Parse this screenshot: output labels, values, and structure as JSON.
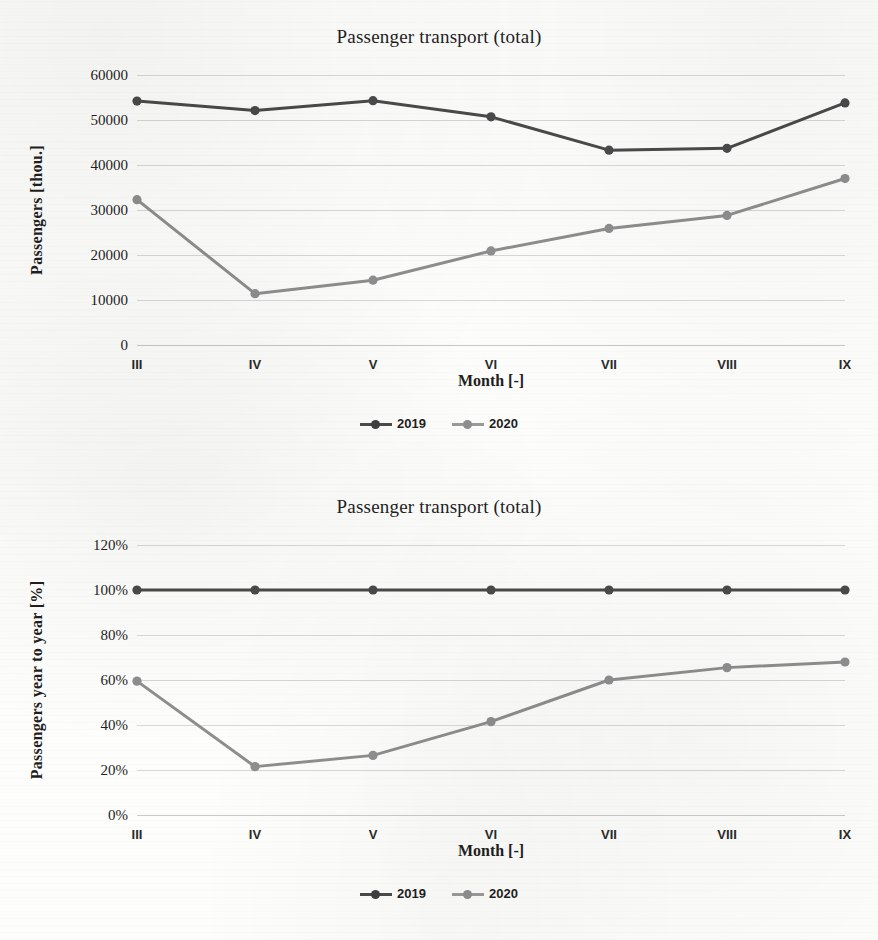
{
  "page": {
    "kind": "scanned-document-figures"
  },
  "figures": [
    {
      "id": "figure-passenger-transport-absolute",
      "title": "Passenger transport (total)",
      "xlabel": "Month [-]",
      "ylabel": "Passengers [thou.]",
      "legend": [
        {
          "label": "2019",
          "color": "#4a4a4a"
        },
        {
          "label": "2020",
          "color": "#8e8e8e"
        }
      ],
      "yticks": [
        "0",
        "10000",
        "20000",
        "30000",
        "40000",
        "50000",
        "60000"
      ],
      "xticks": [
        "III",
        "IV",
        "V",
        "VI",
        "VII",
        "VIII",
        "IX"
      ]
    },
    {
      "id": "figure-passenger-transport-yoy",
      "title": "Passenger transport (total)",
      "xlabel": "Month [-]",
      "ylabel": "Passengers year to year  [%]",
      "legend": [
        {
          "label": "2019",
          "color": "#4a4a4a"
        },
        {
          "label": "2020",
          "color": "#8e8e8e"
        }
      ],
      "yticks": [
        "0%",
        "20%",
        "40%",
        "60%",
        "80%",
        "100%",
        "120%"
      ],
      "xticks": [
        "III",
        "IV",
        "V",
        "VI",
        "VII",
        "VIII",
        "IX"
      ]
    }
  ],
  "chart_data": [
    {
      "type": "line",
      "title": "Passenger transport (total)",
      "xlabel": "Month [-]",
      "ylabel": "Passengers [thou.]",
      "categories": [
        "III",
        "IV",
        "V",
        "VI",
        "VII",
        "VIII",
        "IX"
      ],
      "series": [
        {
          "name": "2019",
          "color": "#4a4a4a",
          "values": [
            54200,
            52100,
            54300,
            50700,
            43300,
            43700,
            53800
          ]
        },
        {
          "name": "2020",
          "color": "#8e8e8e",
          "values": [
            32300,
            11400,
            14400,
            20900,
            25900,
            28800,
            37000
          ]
        }
      ],
      "ylim": [
        0,
        60000
      ],
      "ytick_step": 10000,
      "grid": true,
      "legend_position": "bottom",
      "markers": "circle"
    },
    {
      "type": "line",
      "title": "Passenger transport (total)",
      "xlabel": "Month [-]",
      "ylabel": "Passengers year to year  [%]",
      "categories": [
        "III",
        "IV",
        "V",
        "VI",
        "VII",
        "VIII",
        "IX"
      ],
      "series": [
        {
          "name": "2019",
          "color": "#4a4a4a",
          "values": [
            100,
            100,
            100,
            100,
            100,
            100,
            100
          ]
        },
        {
          "name": "2020",
          "color": "#8e8e8e",
          "values": [
            59.5,
            21.5,
            26.5,
            41.5,
            60.0,
            65.5,
            68.0
          ]
        }
      ],
      "ylim": [
        0,
        120
      ],
      "ytick_step": 20,
      "grid": true,
      "legend_position": "bottom",
      "markers": "circle",
      "unit": "%"
    }
  ]
}
